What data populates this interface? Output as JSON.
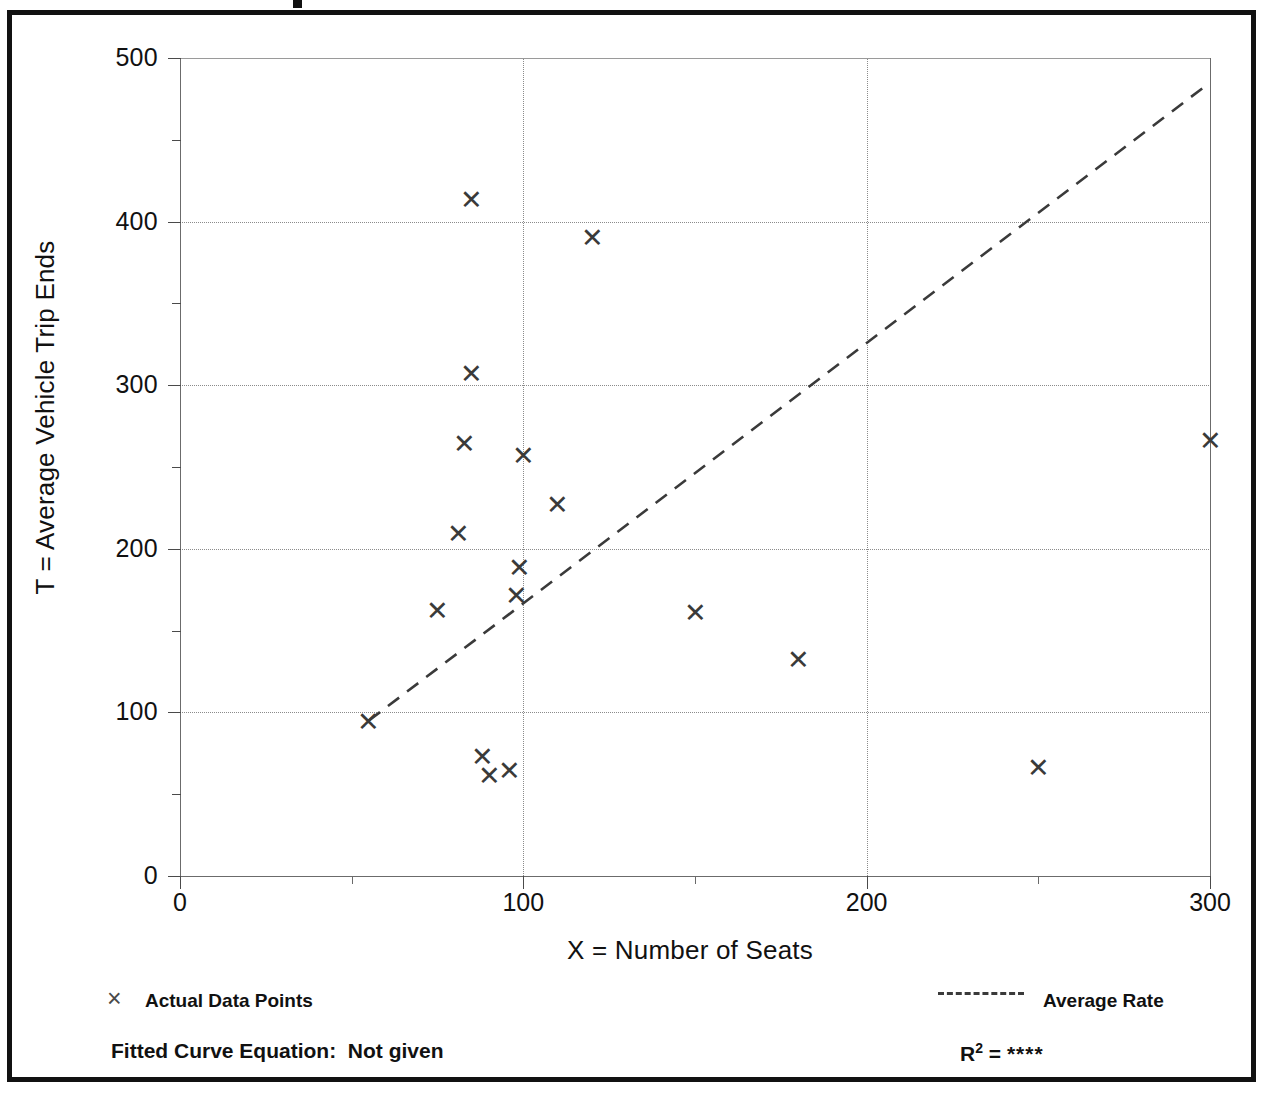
{
  "figure": {
    "frame_color": "#111111",
    "background": "#ffffff",
    "title_fragment_visible": true
  },
  "axes": {
    "y_title": "T = Average Vehicle Trip Ends",
    "x_title": "X = Number of Seats",
    "y_ticks": [
      0,
      100,
      200,
      300,
      400,
      500
    ],
    "y_minor_ticks": [
      50,
      150,
      250,
      350,
      450
    ],
    "x_ticks": [
      0,
      100,
      200,
      300
    ],
    "x_minor_ticks": [
      50,
      150,
      250
    ]
  },
  "legend": {
    "data_marker": "×",
    "data_label": "Actual Data Points",
    "line_label": "Average Rate"
  },
  "footer": {
    "fitted_equation_label": "Fitted Curve Equation:",
    "fitted_equation_value": "Not given",
    "r2_label": "R",
    "r2_exponent": "2",
    "r2_equals": "=",
    "r2_value": "****"
  },
  "chart_data": {
    "type": "scatter",
    "title": "",
    "xlabel": "X = Number of Seats",
    "ylabel": "T = Average Vehicle Trip Ends",
    "xlim": [
      0,
      300
    ],
    "ylim": [
      0,
      500
    ],
    "grid": true,
    "x_major_step": 100,
    "y_major_step": 100,
    "legend_position": "below-plot",
    "series": [
      {
        "name": "Actual Data Points",
        "marker": "x",
        "color": "#3a3a3a",
        "points": [
          {
            "x": 55,
            "y": 94
          },
          {
            "x": 75,
            "y": 162
          },
          {
            "x": 85,
            "y": 413
          },
          {
            "x": 85,
            "y": 307
          },
          {
            "x": 83,
            "y": 264
          },
          {
            "x": 81,
            "y": 209
          },
          {
            "x": 88,
            "y": 73
          },
          {
            "x": 90,
            "y": 61
          },
          {
            "x": 96,
            "y": 64
          },
          {
            "x": 98,
            "y": 171
          },
          {
            "x": 99,
            "y": 188
          },
          {
            "x": 100,
            "y": 257
          },
          {
            "x": 110,
            "y": 227
          },
          {
            "x": 120,
            "y": 390
          },
          {
            "x": 150,
            "y": 161
          },
          {
            "x": 180,
            "y": 132
          },
          {
            "x": 250,
            "y": 66
          },
          {
            "x": 300,
            "y": 266
          }
        ]
      }
    ],
    "trend_line": {
      "name": "Average Rate",
      "style": "dashed",
      "color": "#3a3a3a",
      "x_start": 55,
      "y_start": 95,
      "x_end": 300,
      "y_end": 485
    }
  }
}
